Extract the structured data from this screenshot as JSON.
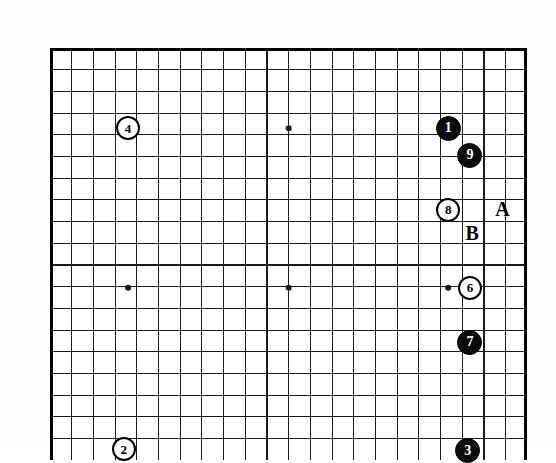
{
  "diagram": {
    "type": "go-board-diagram",
    "board": {
      "left": 50,
      "top": 48,
      "cell": 21.7,
      "cols": 22,
      "rows": 19,
      "line_color": "#1a1a1a",
      "border_color": "#000000",
      "background": "#ffffff",
      "line_width": 1.15,
      "border_width": 3.0,
      "star_point_radius": 3.0,
      "star_points": [
        {
          "col": 3.6,
          "row": 3.7
        },
        {
          "col": 11.0,
          "row": 3.7
        },
        {
          "col": 3.6,
          "row": 11.05
        },
        {
          "col": 11.0,
          "row": 11.05
        },
        {
          "col": 18.35,
          "row": 11.05
        }
      ]
    },
    "stones": [
      {
        "id": "stone-1",
        "label": "1",
        "color": "black",
        "col": 18.35,
        "row": 3.7,
        "radius": 12.5,
        "font_size": 14
      },
      {
        "id": "stone-9",
        "label": "9",
        "color": "black",
        "col": 19.35,
        "row": 4.95,
        "radius": 12.5,
        "font_size": 14
      },
      {
        "id": "stone-8",
        "label": "8",
        "color": "white",
        "col": 18.35,
        "row": 7.45,
        "radius": 12.0,
        "font_size": 13
      },
      {
        "id": "stone-6",
        "label": "6",
        "color": "white",
        "col": 19.35,
        "row": 11.05,
        "radius": 12.0,
        "font_size": 13
      },
      {
        "id": "stone-7",
        "label": "7",
        "color": "black",
        "col": 19.35,
        "row": 13.55,
        "radius": 12.5,
        "font_size": 14
      },
      {
        "id": "stone-4",
        "label": "4",
        "color": "white",
        "col": 3.6,
        "row": 3.7,
        "radius": 12.0,
        "font_size": 13
      },
      {
        "id": "stone-2",
        "label": "2",
        "color": "white",
        "col": 3.4,
        "row": 18.5,
        "radius": 12.0,
        "font_size": 13
      },
      {
        "id": "stone-3",
        "label": "3",
        "color": "black",
        "col": 19.25,
        "row": 18.55,
        "radius": 12.5,
        "font_size": 14
      }
    ],
    "markers": [
      {
        "id": "marker-a",
        "label": "A",
        "col": 20.85,
        "row": 7.42,
        "font_size": 20
      },
      {
        "id": "marker-b",
        "label": "B",
        "col": 19.45,
        "row": 8.52,
        "font_size": 20
      }
    ]
  }
}
